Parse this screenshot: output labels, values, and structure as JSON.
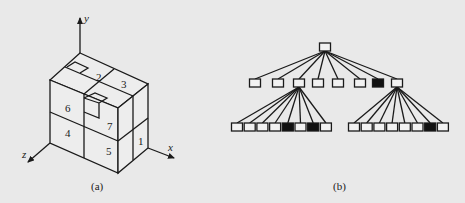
{
  "figure_a": {
    "caption": "(a)",
    "axes": {
      "x": "x",
      "y": "y",
      "z": "z"
    },
    "region_labels": [
      "1",
      "2",
      "3",
      "4",
      "5",
      "6",
      "7"
    ]
  },
  "figure_b": {
    "caption": "(b)",
    "colors": {
      "empty": "#f2f2f2",
      "full": "#111111"
    },
    "root": {
      "filled": false
    },
    "level1": [
      false,
      false,
      false,
      false,
      false,
      false,
      true,
      false
    ],
    "level1_expanded": [
      2,
      7
    ],
    "level2_left": [
      false,
      false,
      false,
      false,
      true,
      false,
      true,
      false
    ],
    "level2_right": [
      false,
      false,
      false,
      false,
      false,
      false,
      true,
      false
    ]
  }
}
